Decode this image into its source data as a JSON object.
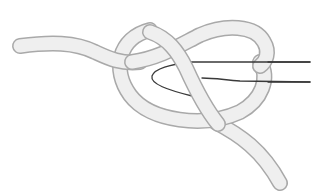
{
  "figure": {
    "width": 325,
    "height": 193,
    "colors": {
      "background": "#ffffff",
      "rope_fill": "#efefef",
      "rope_outline": "#a9a9a9",
      "thin_line": "#3a3a3a"
    },
    "rope": {
      "width": 14,
      "outline_width": 16
    },
    "elements": [
      {
        "name": "left-tail",
        "description": "standing end of rope entering from left"
      },
      {
        "name": "main-loop",
        "description": "large loop of rope"
      },
      {
        "name": "crossing-strand",
        "description": "strand crossing through loop"
      },
      {
        "name": "lower-tail",
        "description": "working end exiting lower right"
      },
      {
        "name": "thin-cord",
        "description": "thin cord passing through knot forming a hook"
      }
    ]
  }
}
